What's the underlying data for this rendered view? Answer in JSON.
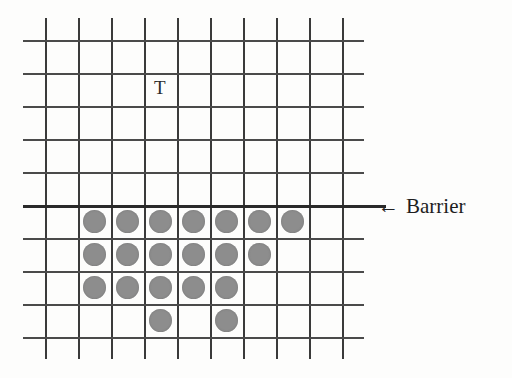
{
  "figure": {
    "title": "",
    "grid": {
      "columns": 9,
      "rows": 9,
      "vertical_lines": 10,
      "horizontal_lines": 10,
      "origin_x": 45,
      "origin_y": 40,
      "cell_size": 33,
      "line_color": "#3a3a3a",
      "line_overhang": 22
    },
    "barrier": {
      "row_index": 5,
      "label": "Barrier",
      "arrow_glyph": "←",
      "line_color": "#2a2a2a",
      "line_extra_length": 22,
      "label_x": 378,
      "label_y": 196
    },
    "target_label": {
      "text": "T",
      "x": 154,
      "y": 78,
      "color": "#2b2b2b"
    },
    "tokens": {
      "color": "#8d8d8d",
      "diameter": 23,
      "rows": [
        {
          "row": 5,
          "columns": [
            1,
            2,
            3,
            4,
            5,
            6,
            7
          ]
        },
        {
          "row": 6,
          "columns": [
            1,
            2,
            3,
            4,
            5,
            6
          ]
        },
        {
          "row": 7,
          "columns": [
            1,
            2,
            3,
            4,
            5
          ]
        },
        {
          "row": 8,
          "columns": [
            3,
            5
          ]
        }
      ],
      "total_count": 20
    }
  }
}
